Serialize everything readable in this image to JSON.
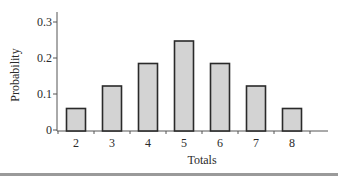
{
  "chart_data": {
    "type": "bar",
    "title": "",
    "xlabel": "Totals",
    "ylabel": "Probability",
    "categories": [
      "2",
      "3",
      "4",
      "5",
      "6",
      "7",
      "8"
    ],
    "values": [
      0.0625,
      0.125,
      0.1875,
      0.25,
      0.1875,
      0.125,
      0.0625
    ],
    "ylim": [
      0,
      0.33
    ],
    "yticks": [
      0,
      0.1,
      0.2,
      0.3
    ],
    "ytick_labels": [
      "0",
      "0.1",
      "0.2",
      "0.3"
    ],
    "grid": false,
    "legend": null
  },
  "colors": {
    "bar_fill": "#d3d3d3",
    "bar_stroke": "#2a2a2a",
    "axis": "#555555",
    "text": "#2a2a2a"
  }
}
